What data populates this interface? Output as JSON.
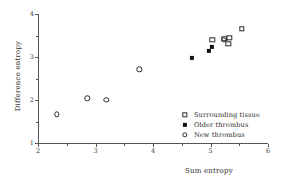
{
  "chart_data": {
    "type": "scatter",
    "title": "",
    "xlabel": "Sum entropy",
    "ylabel": "Difference entropy",
    "xlim": [
      2,
      6
    ],
    "ylim": [
      1,
      4
    ],
    "xticks": [
      2,
      3,
      4,
      5,
      6
    ],
    "yticks": [
      1,
      2,
      3,
      4
    ],
    "xminorticks": [
      2.5,
      3.5,
      4.5,
      5.5
    ],
    "yminorticks": [
      1.5,
      2.5,
      3.5
    ],
    "grid": false,
    "legend_position": "lower right",
    "series": [
      {
        "name": "Surrounding tissue",
        "marker": "open-square",
        "points": [
          {
            "x": 5.03,
            "y": 3.4
          },
          {
            "x": 5.24,
            "y": 3.43
          },
          {
            "x": 5.33,
            "y": 3.45
          },
          {
            "x": 5.31,
            "y": 3.31
          },
          {
            "x": 5.54,
            "y": 3.66
          }
        ]
      },
      {
        "name": "Older thrombus",
        "marker": "filled-square",
        "points": [
          {
            "x": 4.67,
            "y": 2.98
          },
          {
            "x": 4.97,
            "y": 3.14
          },
          {
            "x": 5.02,
            "y": 3.24
          }
        ]
      },
      {
        "name": "New thrombus",
        "marker": "open-circle",
        "points": [
          {
            "x": 2.33,
            "y": 1.67
          },
          {
            "x": 2.86,
            "y": 2.04
          },
          {
            "x": 3.19,
            "y": 2.0
          },
          {
            "x": 3.76,
            "y": 2.71
          },
          {
            "x": 5.23,
            "y": 3.4
          }
        ]
      }
    ]
  },
  "axes": {
    "x_tick_labels": [
      "2",
      "3",
      "4",
      "5",
      "6"
    ],
    "y_tick_labels": [
      "1",
      "2",
      "3",
      "4"
    ],
    "x_title": "Sum entropy",
    "y_title": "Difference entropy"
  },
  "legend": {
    "entries": [
      {
        "label": "Surrounding tissue",
        "marker": "open-square"
      },
      {
        "label": "Older thrombus",
        "marker": "filled-square"
      },
      {
        "label": "New thrombus",
        "marker": "open-circle"
      }
    ]
  },
  "colors": {
    "axis": "#555555",
    "text": "#2c2c2c",
    "marker_stroke": "#2b2b2b",
    "marker_fill": "#111111",
    "background": "#ffffff"
  }
}
